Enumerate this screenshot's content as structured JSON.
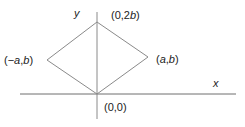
{
  "diagram": {
    "type": "coordinate-geometry",
    "axes": {
      "x_label": "x",
      "y_label": "y",
      "origin_px": [
        97,
        94
      ]
    },
    "shape": "rhombus",
    "vertices": [
      {
        "id": "origin",
        "label": "(0,0)",
        "px": [
          97,
          94
        ]
      },
      {
        "id": "right",
        "label": "(a,b)",
        "px": [
          148,
          57
        ]
      },
      {
        "id": "top",
        "label": "(0,2b)",
        "px": [
          97,
          22
        ]
      },
      {
        "id": "left",
        "label": "(−a,b)",
        "px": [
          47,
          60
        ]
      }
    ],
    "colors": {
      "axis": "#6e6e6e",
      "shape": "#8a8a8a",
      "text": "#222222"
    }
  }
}
